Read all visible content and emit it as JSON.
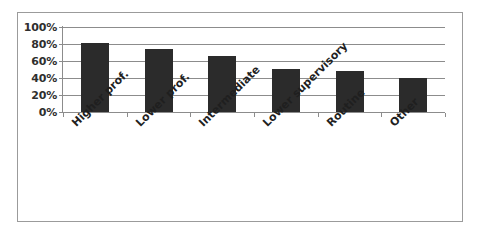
{
  "chart_data": {
    "type": "bar",
    "title": "",
    "subtitle": "",
    "xlabel": "",
    "ylabel": "",
    "categories": [
      "Higher prof.",
      "Lower prof.",
      "Intermediate",
      "Lower supervisory",
      "Routine",
      "Other"
    ],
    "values": [
      81,
      74,
      66,
      51,
      48,
      40
    ],
    "value_labels": [
      "81%",
      "74%",
      "66%",
      "51%",
      "48%",
      "40%"
    ],
    "ylim": [
      0,
      100
    ],
    "ytick_values": [
      0,
      20,
      40,
      60,
      80,
      100
    ],
    "ytick_labels": [
      "0%",
      "20%",
      "40%",
      "60%",
      "80%",
      "100%"
    ],
    "grid": true,
    "grid_axis": "y",
    "legend": false,
    "legend_position": "none",
    "bar_color": "#2b2b2b",
    "gridline_color": "#8c8c8c",
    "axis_color": "#8c8c8c",
    "background_color": "#ffffff",
    "border_color": "#9b9b9b",
    "label_rotation_degrees": -45
  }
}
